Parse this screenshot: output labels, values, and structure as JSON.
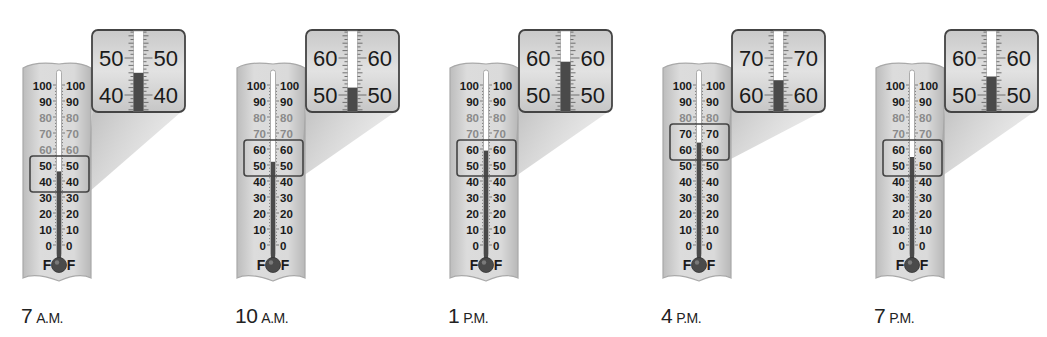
{
  "figure": {
    "scale_unit": "F",
    "scale_labels": [
      100,
      90,
      80,
      70,
      60,
      50,
      40,
      30,
      20,
      10,
      0
    ],
    "colors": {
      "body": "#d7d7d7",
      "body_edge": "#a9a9a9",
      "mercury": "#4a4a4a",
      "tube": "#ffffff",
      "inset_bg": "#d9d9d9",
      "inset_border": "#444444",
      "text": "#1a1a1a"
    }
  },
  "thermometers": [
    {
      "time_num": "7",
      "time_mer": "A.M.",
      "reading": 46,
      "zoom_range": [
        40,
        50
      ],
      "offset_x": 0
    },
    {
      "time_num": "10",
      "time_mer": "A.M.",
      "reading": 52,
      "zoom_range": [
        50,
        60
      ],
      "offset_x": 214
    },
    {
      "time_num": "1",
      "time_mer": "P.M.",
      "reading": 59,
      "zoom_range": [
        50,
        60
      ],
      "offset_x": 427
    },
    {
      "time_num": "4",
      "time_mer": "P.M.",
      "reading": 64,
      "zoom_range": [
        60,
        70
      ],
      "offset_x": 640
    },
    {
      "time_num": "7",
      "time_mer": "P.M.",
      "reading": 55,
      "zoom_range": [
        50,
        60
      ],
      "offset_x": 853
    }
  ],
  "chart_data": {
    "type": "table",
    "title": "",
    "categories": [
      "7 A.M.",
      "10 A.M.",
      "1 P.M.",
      "4 P.M.",
      "7 P.M."
    ],
    "values": [
      46,
      52,
      59,
      64,
      55
    ],
    "unit": "°F",
    "scale": {
      "min": 0,
      "max": 100,
      "major_step": 10
    },
    "zoomed_insets": [
      [
        40,
        50
      ],
      [
        50,
        60
      ],
      [
        50,
        60
      ],
      [
        60,
        70
      ],
      [
        50,
        60
      ]
    ]
  }
}
